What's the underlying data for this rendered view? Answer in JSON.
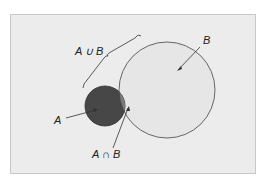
{
  "diagram": {
    "type": "venn",
    "labels": {
      "a": "A",
      "b": "B",
      "union": "A ∪ B",
      "intersection": "A ∩ B"
    },
    "colors": {
      "panel": "#ececec",
      "circle_a_fill": "#474747",
      "circle_b_fill": "#e6e6e6",
      "intersection_fill": "#7a7a7a",
      "stroke": "#333333"
    }
  }
}
